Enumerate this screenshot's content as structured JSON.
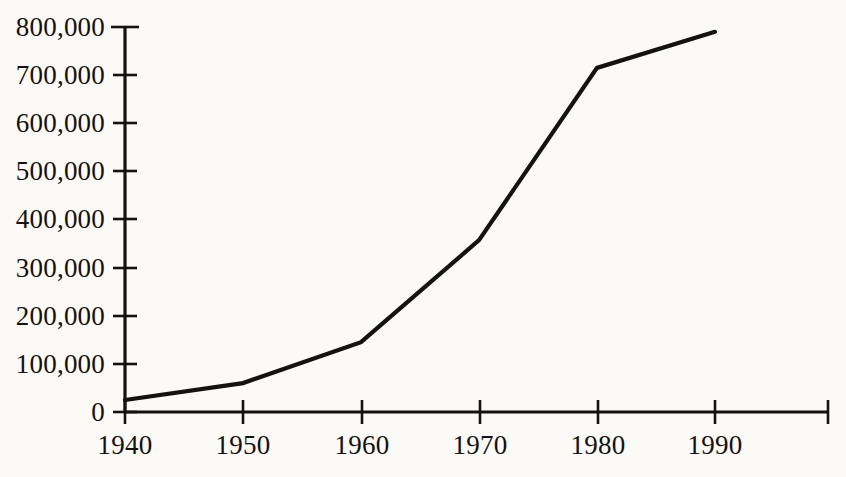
{
  "chart_data": {
    "type": "line",
    "title": "",
    "subtitle": "",
    "xlabel": "",
    "ylabel": "",
    "x": [
      1940,
      1950,
      1960,
      1970,
      1980,
      1990
    ],
    "categories": [
      "1940",
      "1950",
      "1960",
      "1970",
      "1980",
      "1990"
    ],
    "values": [
      25000,
      60000,
      145000,
      357000,
      715000,
      790000
    ],
    "series": [
      {
        "name": "",
        "values": [
          25000,
          60000,
          145000,
          357000,
          715000,
          790000
        ]
      }
    ],
    "xlim": [
      1940,
      1990
    ],
    "ylim": [
      0,
      800000
    ],
    "xticks": [
      "1940",
      "1950",
      "1960",
      "1970",
      "1980",
      "1990"
    ],
    "yticks": [
      "0",
      "100,000",
      "200,000",
      "300,000",
      "400,000",
      "500,000",
      "600,000",
      "700,000",
      "800,000"
    ],
    "ytick_values": [
      0,
      100000,
      200000,
      300000,
      400000,
      500000,
      600000,
      700000,
      800000
    ],
    "grid": false,
    "legend": false,
    "legend_position": "none",
    "line_color": "#15120f",
    "background_color": "#fbfaf7",
    "axis_color": "#15120f",
    "annotations": []
  },
  "axis": {
    "y_tick_labels": [
      "800,000",
      "700,000",
      "600,000",
      "500,000",
      "400,000",
      "300,000",
      "200,000",
      "100,000",
      "0"
    ],
    "x_tick_labels": [
      "1940",
      "1950",
      "1960",
      "1970",
      "1980",
      "1990"
    ]
  }
}
